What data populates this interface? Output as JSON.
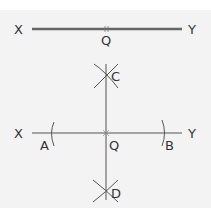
{
  "figure1": {
    "description": "Line segment XY with midpoint Q",
    "labels": {
      "left": "X",
      "right": "Y",
      "mid": "Q"
    }
  },
  "figure2": {
    "description": "Perpendicular bisector construction through Q",
    "labels": {
      "left": "X",
      "right": "Y",
      "center": "Q",
      "arc_left": "A",
      "arc_right": "B",
      "top": "C",
      "bottom": "D"
    }
  },
  "colors": {
    "line": "#666666",
    "thin_line": "#555555",
    "text": "#333333",
    "background": "#f3f3f3"
  }
}
